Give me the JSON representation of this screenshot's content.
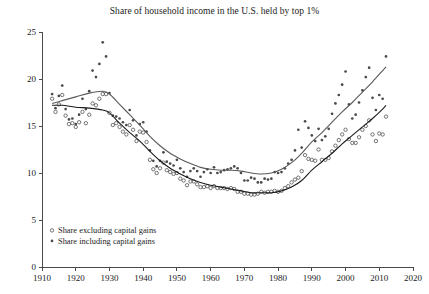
{
  "chart_data": {
    "type": "scatter",
    "title": "Share of household income in the U.S. held by top 1%",
    "xlabel": "",
    "ylabel": "",
    "xlim": [
      1910,
      2020
    ],
    "ylim": [
      0,
      25
    ],
    "xticks": [
      1910,
      1920,
      1930,
      1940,
      1950,
      1960,
      1970,
      1980,
      1990,
      2000,
      2010,
      2020
    ],
    "yticks": [
      0,
      5,
      10,
      15,
      20,
      25
    ],
    "grid": false,
    "legend_position": "bottom-left",
    "marker_color": "#4a4a4a",
    "line_color_excluding": "#1b1b1b",
    "line_color_including": "#5a5a5a",
    "series": [
      {
        "name": "Share excluding capital gains",
        "marker": "open-circle",
        "x": [
          1913,
          1914,
          1915,
          1916,
          1917,
          1918,
          1919,
          1920,
          1921,
          1922,
          1923,
          1924,
          1925,
          1926,
          1927,
          1928,
          1929,
          1930,
          1931,
          1932,
          1933,
          1934,
          1935,
          1936,
          1937,
          1938,
          1939,
          1940,
          1941,
          1942,
          1943,
          1944,
          1945,
          1946,
          1947,
          1948,
          1949,
          1950,
          1951,
          1952,
          1953,
          1954,
          1955,
          1956,
          1957,
          1958,
          1959,
          1960,
          1961,
          1962,
          1963,
          1964,
          1965,
          1966,
          1967,
          1968,
          1969,
          1970,
          1971,
          1972,
          1973,
          1974,
          1975,
          1976,
          1977,
          1978,
          1979,
          1980,
          1981,
          1982,
          1983,
          1984,
          1985,
          1986,
          1987,
          1988,
          1989,
          1990,
          1991,
          1992,
          1993,
          1994,
          1995,
          1996,
          1997,
          1998,
          1999,
          2000,
          2001,
          2002,
          2003,
          2004,
          2005,
          2006,
          2007,
          2008,
          2009,
          2010,
          2011,
          2012
        ],
        "y": [
          17.9,
          16.5,
          17.3,
          18.3,
          16.1,
          15.2,
          15.3,
          14.9,
          15.4,
          16.5,
          15.3,
          16.2,
          17.4,
          17.2,
          17.9,
          18.4,
          18.4,
          16.4,
          15.1,
          15.3,
          14.9,
          14.4,
          14.1,
          15.1,
          14.6,
          13.4,
          14.4,
          14.3,
          13.3,
          11.4,
          10.4,
          10.0,
          10.5,
          11.1,
          10.3,
          10.1,
          9.9,
          10.0,
          9.4,
          9.2,
          8.7,
          9.1,
          9.1,
          8.8,
          8.5,
          8.5,
          8.6,
          8.4,
          8.6,
          8.4,
          8.4,
          8.4,
          8.3,
          8.4,
          8.3,
          8.0,
          8.0,
          7.8,
          7.8,
          7.7,
          7.7,
          7.8,
          8.0,
          7.9,
          8.0,
          8.0,
          8.1,
          8.0,
          8.1,
          8.4,
          8.6,
          9.0,
          9.3,
          9.5,
          10.2,
          11.9,
          11.5,
          11.4,
          11.3,
          12.5,
          11.4,
          11.4,
          11.6,
          12.3,
          12.9,
          13.5,
          14.1,
          14.6,
          13.6,
          13.2,
          13.2,
          13.8,
          14.6,
          15.0,
          15.6,
          14.1,
          13.4,
          14.2,
          14.1,
          16.0
        ]
      },
      {
        "name": "Share including capital gains",
        "marker": "filled-circle",
        "x": [
          1913,
          1914,
          1915,
          1916,
          1917,
          1918,
          1919,
          1920,
          1921,
          1922,
          1923,
          1924,
          1925,
          1926,
          1927,
          1928,
          1929,
          1930,
          1931,
          1932,
          1933,
          1934,
          1935,
          1936,
          1937,
          1938,
          1939,
          1940,
          1941,
          1942,
          1943,
          1944,
          1945,
          1946,
          1947,
          1948,
          1949,
          1950,
          1951,
          1952,
          1953,
          1954,
          1955,
          1956,
          1957,
          1958,
          1959,
          1960,
          1961,
          1962,
          1963,
          1964,
          1965,
          1966,
          1967,
          1968,
          1969,
          1970,
          1971,
          1972,
          1973,
          1974,
          1975,
          1976,
          1977,
          1978,
          1979,
          1980,
          1981,
          1982,
          1983,
          1984,
          1985,
          1986,
          1987,
          1988,
          1989,
          1990,
          1991,
          1992,
          1993,
          1994,
          1995,
          1996,
          1997,
          1998,
          1999,
          2000,
          2001,
          2002,
          2003,
          2004,
          2005,
          2006,
          2007,
          2008,
          2009,
          2010,
          2011,
          2012
        ],
        "y": [
          18.4,
          16.9,
          18.2,
          19.3,
          16.8,
          15.7,
          15.8,
          15.2,
          16.2,
          17.9,
          16.8,
          18.7,
          20.9,
          20.2,
          21.6,
          23.9,
          22.4,
          18.5,
          16.1,
          16.0,
          15.8,
          15.4,
          15.1,
          16.7,
          15.6,
          14.0,
          15.2,
          15.4,
          14.4,
          12.4,
          11.3,
          10.7,
          11.3,
          12.2,
          11.2,
          11.0,
          10.8,
          11.4,
          10.5,
          10.1,
          9.6,
          10.2,
          10.5,
          10.2,
          9.6,
          10.1,
          10.4,
          10.0,
          10.6,
          10.0,
          10.1,
          10.3,
          10.4,
          10.5,
          10.7,
          10.5,
          10.0,
          9.2,
          9.2,
          9.5,
          9.4,
          9.0,
          9.0,
          9.4,
          9.3,
          9.4,
          10.1,
          10.0,
          10.1,
          10.5,
          11.0,
          11.4,
          12.4,
          14.6,
          12.7,
          15.5,
          14.8,
          14.0,
          13.4,
          14.7,
          13.5,
          13.9,
          14.7,
          16.3,
          17.4,
          18.3,
          19.4,
          20.8,
          17.3,
          15.8,
          16.2,
          17.5,
          18.8,
          20.2,
          21.2,
          18.0,
          16.7,
          18.3,
          17.9,
          22.4
        ]
      }
    ],
    "trend_lines": [
      {
        "name": "excluding-trend",
        "x": [
          1913,
          1916,
          1920,
          1924,
          1928,
          1930,
          1933,
          1936,
          1939,
          1942,
          1945,
          1948,
          1951,
          1954,
          1957,
          1960,
          1963,
          1966,
          1969,
          1972,
          1975,
          1978,
          1981,
          1984,
          1987,
          1990,
          1993,
          1996,
          1999,
          2002,
          2005,
          2008,
          2011,
          2012
        ],
        "y": [
          17.2,
          17.2,
          17.0,
          16.9,
          16.7,
          16.4,
          15.3,
          14.3,
          13.4,
          12.3,
          11.3,
          10.5,
          9.9,
          9.4,
          9.0,
          8.7,
          8.5,
          8.3,
          8.1,
          7.9,
          7.9,
          7.9,
          8.1,
          8.5,
          9.2,
          10.3,
          11.2,
          12.1,
          13.1,
          14.0,
          14.9,
          15.8,
          16.8,
          17.2
        ]
      },
      {
        "name": "including-trend",
        "x": [
          1913,
          1916,
          1920,
          1924,
          1928,
          1930,
          1933,
          1936,
          1939,
          1942,
          1945,
          1948,
          1951,
          1954,
          1957,
          1960,
          1963,
          1966,
          1969,
          1972,
          1975,
          1978,
          1981,
          1984,
          1987,
          1990,
          1993,
          1996,
          1999,
          2002,
          2005,
          2008,
          2011,
          2012
        ],
        "y": [
          17.4,
          17.7,
          18.1,
          18.5,
          18.7,
          18.4,
          17.3,
          16.2,
          15.1,
          13.9,
          12.9,
          12.1,
          11.5,
          11.0,
          10.6,
          10.4,
          10.3,
          10.3,
          10.2,
          10.0,
          9.9,
          10.0,
          10.4,
          11.1,
          12.1,
          13.3,
          14.3,
          15.4,
          16.5,
          17.5,
          18.6,
          19.7,
          20.9,
          21.3
        ]
      }
    ]
  },
  "legend": {
    "items": [
      {
        "label": "Share excluding capital gains",
        "marker": "open-circle"
      },
      {
        "label": "Share including capital gains",
        "marker": "filled-circle"
      }
    ]
  }
}
